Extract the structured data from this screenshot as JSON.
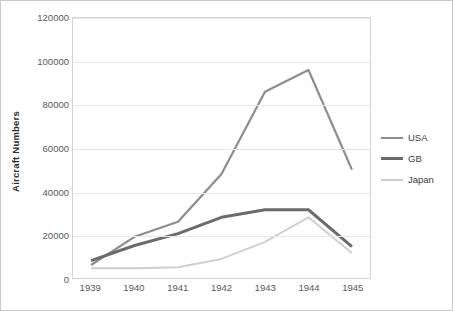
{
  "chart_data": {
    "type": "line",
    "title": "",
    "xlabel": "",
    "ylabel": "Aircraft Numbers",
    "categories": [
      "1939",
      "1940",
      "1941",
      "1942",
      "1943",
      "1944",
      "1945"
    ],
    "x": [
      1939,
      1940,
      1941,
      1942,
      1943,
      1944,
      1945
    ],
    "ylim": [
      0,
      120000
    ],
    "yticks": [
      0,
      20000,
      40000,
      60000,
      80000,
      100000,
      120000
    ],
    "ytick_labels": [
      "0",
      "20000",
      "40000",
      "60000",
      "80000",
      "100000",
      "120000"
    ],
    "grid": true,
    "legend_position": "right",
    "series": [
      {
        "name": "USA",
        "color": "#8c8c8c",
        "width": 2.2,
        "values": [
          6000,
          19000,
          26000,
          48000,
          86000,
          96000,
          50000
        ]
      },
      {
        "name": "GB",
        "color": "#6b6b6b",
        "width": 3.0,
        "values": [
          8000,
          15000,
          20500,
          28000,
          31500,
          31500,
          14500
        ]
      },
      {
        "name": "Japan",
        "color": "#cfcfcf",
        "width": 2.0,
        "values": [
          4500,
          4500,
          5000,
          8800,
          16700,
          28000,
          11500
        ]
      }
    ]
  },
  "colors": {
    "frame_border": "#c9c9c9",
    "plot_border": "#d4d4d4",
    "gridline": "#e6e6e6",
    "tick_text": "#585858",
    "axis_title_text": "#2b2b2b",
    "legend_text": "#3a3a3a",
    "background": "#ffffff"
  }
}
